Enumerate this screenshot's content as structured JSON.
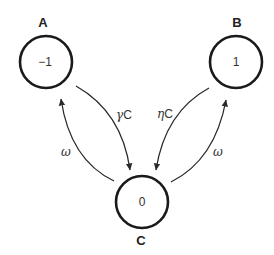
{
  "diagram": {
    "type": "state-transition",
    "nodes": [
      {
        "id": "A",
        "label": "A",
        "value": "−1",
        "cx": 46,
        "cy": 62,
        "r": 26
      },
      {
        "id": "B",
        "label": "B",
        "value": "1",
        "cx": 236,
        "cy": 62,
        "r": 26
      },
      {
        "id": "C",
        "label": "C",
        "value": "0",
        "cx": 142,
        "cy": 202,
        "r": 26
      }
    ],
    "edges": [
      {
        "from": "A",
        "to": "C",
        "label_greek": "γ",
        "label_suffix": "C"
      },
      {
        "from": "C",
        "to": "A",
        "label_greek": "ω",
        "label_suffix": ""
      },
      {
        "from": "B",
        "to": "C",
        "label_greek": "η",
        "label_suffix": "C"
      },
      {
        "from": "C",
        "to": "B",
        "label_greek": "ω",
        "label_suffix": ""
      }
    ],
    "colors": {
      "stroke": "#1a1a1a",
      "background": "#ffffff"
    }
  }
}
